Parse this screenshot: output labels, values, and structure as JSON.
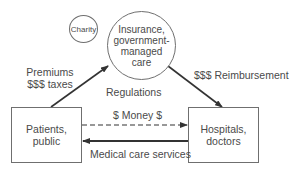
{
  "diagram": {
    "type": "flow",
    "nodes": {
      "insurance": {
        "label": "Insurance,\ngovernment-\nmanaged\ncare",
        "shape": "circle"
      },
      "charity": {
        "label": "Charity",
        "shape": "circle"
      },
      "patients": {
        "label": "Patients,\npublic",
        "shape": "box"
      },
      "hospitals": {
        "label": "Hospitals,\ndoctors",
        "shape": "box"
      }
    },
    "edges": {
      "premiums": {
        "from": "patients",
        "to": "insurance",
        "label": "Premiums\n$$$ taxes",
        "style": "solid"
      },
      "reimbursement": {
        "from": "insurance",
        "to": "hospitals",
        "label": "$$$ Reimbursement",
        "style": "solid"
      },
      "money": {
        "from": "patients",
        "to": "hospitals",
        "label": "$ Money $",
        "style": "dashed"
      },
      "services": {
        "from": "hospitals",
        "to": "patients",
        "label": "Medical care services",
        "style": "solid"
      }
    },
    "annotations": {
      "regulations": "Regulations"
    },
    "colors": {
      "line": "#333333",
      "border": "#6f6f6f",
      "text": "#4a4a4a"
    }
  }
}
